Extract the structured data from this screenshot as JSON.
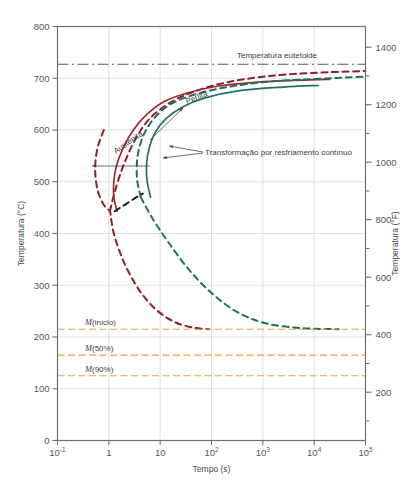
{
  "chart_data": {
    "type": "line",
    "title": "",
    "xlabel": "Tempo (s)",
    "ylabel": "Temperatura (°C)",
    "ylabel_right": "Temperatura (°F)",
    "xscale": "log",
    "xlim": [
      0.1,
      100000
    ],
    "ylim": [
      0,
      800
    ],
    "ylim_right": [
      32,
      1472
    ],
    "grid": true,
    "legend": "none",
    "x_ticks": [
      {
        "value": 0.1,
        "label": "10",
        "sup": "-1"
      },
      {
        "value": 1,
        "label": "1",
        "sup": ""
      },
      {
        "value": 10,
        "label": "10",
        "sup": ""
      },
      {
        "value": 100,
        "label": "10",
        "sup": "2"
      },
      {
        "value": 1000,
        "label": "10",
        "sup": "3"
      },
      {
        "value": 10000,
        "label": "10",
        "sup": "4"
      },
      {
        "value": 100000,
        "label": "10",
        "sup": "5"
      }
    ],
    "y_ticks_left": [
      0,
      100,
      200,
      300,
      400,
      500,
      600,
      700,
      800
    ],
    "y_ticks_right_major": [
      200,
      400,
      600,
      800,
      1000,
      1200,
      1400
    ],
    "y_ticks_right_minor": [
      100,
      300,
      500,
      700,
      900,
      1100,
      1300
    ],
    "annotations": [
      {
        "name": "eutectoid-temperature-label",
        "text": "Temperatura eutetoide",
        "value_c": 727
      },
      {
        "name": "austenite-label",
        "text": "Austenita"
      },
      {
        "name": "pearlite-label",
        "text": "Perlita"
      },
      {
        "name": "continuous-cooling-label",
        "text": "Transformação por resfriamento contínuo"
      }
    ],
    "martensite_lines": [
      {
        "name": "m-start",
        "label_m": "M",
        "label_rest": "(início)",
        "value_c": 215
      },
      {
        "name": "m-50",
        "label_m": "M",
        "label_rest": "(50%)",
        "value_c": 165
      },
      {
        "name": "m-90",
        "label_m": "M",
        "label_rest": "(90%)",
        "value_c": 125
      }
    ],
    "series": [
      {
        "name": "isothermal-transformation-start",
        "style": "dashed",
        "color": "#8e2026",
        "comment": "TTT start (dark red dashed)",
        "points": [
          [
            0.8,
            600
          ],
          [
            0.62,
            570
          ],
          [
            0.55,
            540
          ],
          [
            0.55,
            510
          ],
          [
            0.62,
            480
          ],
          [
            0.8,
            455
          ],
          [
            1.05,
            443
          ],
          [
            1.1,
            430
          ],
          [
            1.25,
            400
          ],
          [
            1.7,
            360
          ],
          [
            2.6,
            320
          ],
          [
            4.5,
            282
          ],
          [
            9,
            250
          ],
          [
            20,
            228
          ],
          [
            45,
            218
          ],
          [
            90,
            215
          ],
          [
            1.05,
            443
          ],
          [
            1.3,
            480
          ],
          [
            1.9,
            530
          ],
          [
            3.2,
            580
          ],
          [
            6,
            620
          ],
          [
            14,
            650
          ],
          [
            40,
            672
          ],
          [
            160,
            690
          ],
          [
            1000,
            703
          ],
          [
            8000,
            710
          ],
          [
            100000,
            714
          ]
        ]
      },
      {
        "name": "isothermal-transformation-finish",
        "style": "solid",
        "color": "#9e2a2f",
        "comment": "TTT finish (dark red solid)",
        "points": [
          [
            1.45,
            443
          ],
          [
            1.25,
            470
          ],
          [
            1.25,
            500
          ],
          [
            1.4,
            530
          ],
          [
            1.9,
            565
          ],
          [
            3,
            600
          ],
          [
            5.5,
            630
          ],
          [
            12,
            655
          ],
          [
            35,
            672
          ],
          [
            140,
            685
          ],
          [
            900,
            693
          ],
          [
            8000,
            697
          ],
          [
            20000,
            698
          ]
        ]
      },
      {
        "name": "continuous-cooling-transformation-start",
        "style": "dashed",
        "color": "#1f7060",
        "comment": "CCT start (green dashed)",
        "points": [
          [
            4.2,
            470
          ],
          [
            3.6,
            500
          ],
          [
            3.5,
            530
          ],
          [
            3.8,
            560
          ],
          [
            5,
            595
          ],
          [
            8,
            625
          ],
          [
            16,
            650
          ],
          [
            45,
            668
          ],
          [
            200,
            683
          ],
          [
            1500,
            694
          ],
          [
            20000,
            700
          ],
          [
            100000,
            703
          ],
          [
            4.2,
            470
          ],
          [
            7,
            430
          ],
          [
            14,
            385
          ],
          [
            35,
            332
          ],
          [
            100,
            285
          ],
          [
            320,
            248
          ],
          [
            1200,
            226
          ],
          [
            6000,
            217
          ],
          [
            30000,
            215
          ]
        ]
      },
      {
        "name": "continuous-cooling-transformation-finish",
        "style": "solid",
        "color": "#1f7060",
        "comment": "CCT finish (green solid)",
        "points": [
          [
            6.5,
            470
          ],
          [
            5.6,
            500
          ],
          [
            5.4,
            530
          ],
          [
            6,
            562
          ],
          [
            8,
            595
          ],
          [
            13,
            622
          ],
          [
            28,
            645
          ],
          [
            75,
            662
          ],
          [
            350,
            676
          ],
          [
            2500,
            683
          ],
          [
            12000,
            686
          ]
        ]
      },
      {
        "name": "transformation-bainite-boundary",
        "style": "dashed",
        "color": "#1a1a1a",
        "comment": "black dashed segment joining noses",
        "points": [
          [
            1.3,
            443
          ],
          [
            2,
            455
          ],
          [
            3.2,
            468
          ],
          [
            4.6,
            477
          ]
        ]
      }
    ]
  },
  "axes": {
    "x_axis_title": "Tempo (s)",
    "y_axis_title_left": "Temperatura (°C)",
    "y_axis_title_right": "Temperatura (°F)"
  },
  "colors": {
    "dark_red": "#9e2a2f",
    "dark_red_dashed": "#8e2026",
    "green": "#1f7060",
    "orange": "#e8a33d",
    "black": "#1a1a1a",
    "grid": "#d8d8d8",
    "frame": "#6e6f72",
    "text": "#4a4b4f"
  }
}
